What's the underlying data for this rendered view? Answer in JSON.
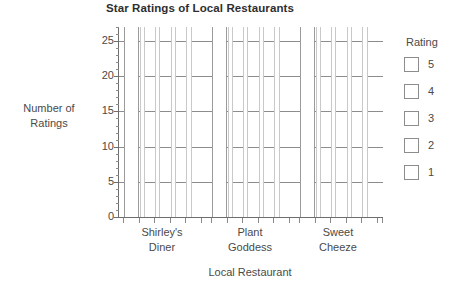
{
  "chart_data": {
    "type": "bar",
    "title": "Star Ratings of Local Restaurants",
    "xlabel": "Local Restaurant",
    "ylabel": "Number of Ratings",
    "ylabel_line1": "Number of",
    "ylabel_line2": "Ratings",
    "grid": true,
    "legend_position": "right",
    "legend_title": "Rating",
    "ylim": [
      0,
      27
    ],
    "yticks": [
      0,
      5,
      10,
      15,
      20,
      25
    ],
    "ytick_labels": [
      "0",
      "5",
      "10",
      "15",
      "20",
      "25"
    ],
    "yminor_step": 1,
    "categories": [
      "Shirley's Diner",
      "Plant Goddess",
      "Sweet Cheeze"
    ],
    "category_lines": [
      [
        "Shirley's",
        "Diner"
      ],
      [
        "Plant",
        "Goddess"
      ],
      [
        "Sweet",
        "Cheeze"
      ]
    ],
    "series": [
      {
        "name": "5",
        "values": [
          27,
          27,
          27
        ]
      },
      {
        "name": "4",
        "values": [
          27,
          27,
          27
        ]
      },
      {
        "name": "3",
        "values": [
          27,
          27,
          27
        ]
      },
      {
        "name": "2",
        "values": [
          27,
          27,
          27
        ]
      },
      {
        "name": "1",
        "values": [
          27,
          27,
          27
        ]
      }
    ],
    "bar_style": "unfilled-outline",
    "note": "All bars are drawn as unfilled white outlines extending past the top of the plot area.",
    "colors": {
      "bar_fill": "#ffffff",
      "bar_outline": "#c9c9c9",
      "axis": "#6d6d6d",
      "gridline": "#8d8d8d",
      "text": "#4a4a4a",
      "title": "#2e2e2e",
      "legend_swatch_fill": "#ffffff",
      "legend_swatch_border": "#8d8d8d"
    }
  },
  "legend": {
    "title": "Rating",
    "items": [
      {
        "label": "5",
        "swatch": "legend-swatch-rating-5"
      },
      {
        "label": "4",
        "swatch": "legend-swatch-rating-4"
      },
      {
        "label": "3",
        "swatch": "legend-swatch-rating-3"
      },
      {
        "label": "2",
        "swatch": "legend-swatch-rating-2"
      },
      {
        "label": "1",
        "swatch": "legend-swatch-rating-1"
      }
    ]
  }
}
